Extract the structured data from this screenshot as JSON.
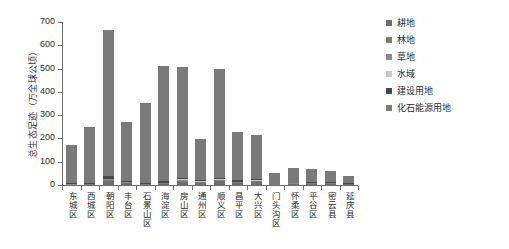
{
  "chart_data": {
    "type": "bar",
    "title": "",
    "subtitle": "",
    "xlabel": "",
    "ylabel": "总生态足迹（万全球公顷）",
    "ylim": [
      0,
      700
    ],
    "yticks": [
      0,
      100,
      200,
      300,
      400,
      500,
      600,
      700
    ],
    "ytick_labels": [
      "0",
      "100",
      "200",
      "300",
      "400",
      "500",
      "600",
      "700"
    ],
    "grid": false,
    "legend_position": "right",
    "stacked": true,
    "categories": [
      "东城区",
      "西城区",
      "朝阳区",
      "丰台区",
      "石景山区",
      "海淀区",
      "房山区",
      "通州区",
      "顺义区",
      "昌平区",
      "大兴区",
      "门头沟区",
      "怀柔区",
      "平谷区",
      "密云县",
      "延庆县"
    ],
    "series": [
      {
        "name": "耕地",
        "color": "#6e6e6e",
        "values": [
          1,
          2,
          18,
          8,
          2,
          6,
          14,
          10,
          16,
          9,
          14,
          2,
          4,
          6,
          6,
          4
        ]
      },
      {
        "name": "林地",
        "color": "#7d7d7d",
        "values": [
          1,
          1,
          5,
          2,
          1,
          2,
          5,
          3,
          4,
          3,
          3,
          1,
          2,
          2,
          2,
          1
        ]
      },
      {
        "name": "草地",
        "color": "#8c8c8c",
        "values": [
          1,
          1,
          3,
          1,
          1,
          1,
          3,
          2,
          3,
          2,
          2,
          1,
          1,
          1,
          1,
          1
        ]
      },
      {
        "name": "水域",
        "color": "#c9c9c9",
        "values": [
          1,
          1,
          2,
          1,
          1,
          1,
          2,
          1,
          2,
          1,
          1,
          0,
          1,
          1,
          1,
          0
        ]
      },
      {
        "name": "建设用地",
        "color": "#4a4a4a",
        "values": [
          3,
          4,
          9,
          5,
          3,
          7,
          8,
          4,
          7,
          5,
          5,
          1,
          2,
          2,
          2,
          1
        ]
      },
      {
        "name": "化石能源用地",
        "color": "#7a7a7a",
        "values": [
          165,
          241,
          628,
          255,
          345,
          495,
          473,
          177,
          465,
          208,
          190,
          45,
          62,
          56,
          50,
          30
        ]
      }
    ],
    "totals": [
      172,
      250,
      665,
      272,
      353,
      512,
      505,
      197,
      497,
      228,
      215,
      50,
      72,
      68,
      62,
      37
    ]
  },
  "legend": {
    "items": [
      {
        "label": "耕地",
        "swatch_name": "legend-swatch-gengdi"
      },
      {
        "label": "林地",
        "swatch_name": "legend-swatch-lindi"
      },
      {
        "label": "草地",
        "swatch_name": "legend-swatch-caodi"
      },
      {
        "label": "水域",
        "swatch_name": "legend-swatch-shuiyu"
      },
      {
        "label": "建设用地",
        "swatch_name": "legend-swatch-jiansheyongdi"
      },
      {
        "label": "化石能源用地",
        "swatch_name": "legend-swatch-huashinengyuanyongdi"
      }
    ]
  },
  "colors": {
    "axis": "#6e6e6e",
    "text": "#2b2b2b",
    "background": "#ffffff"
  }
}
